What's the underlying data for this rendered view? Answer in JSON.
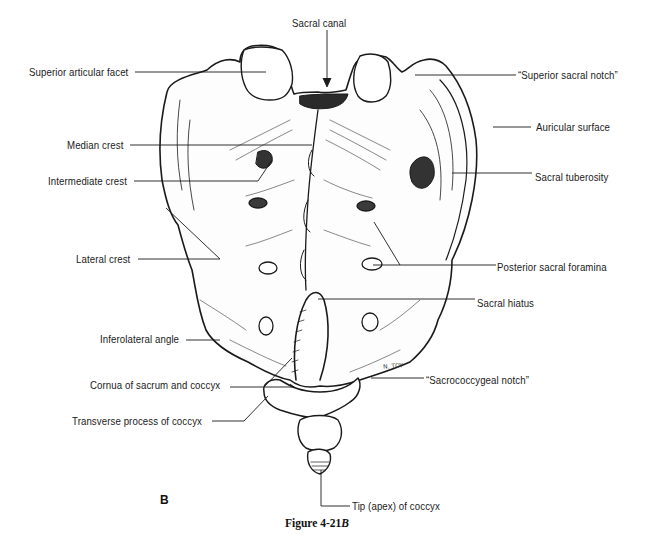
{
  "figure": {
    "panel_letter": "B",
    "caption_prefix": "Figure 4-21",
    "caption_suffix": "B",
    "signature": "N. TOY"
  },
  "labels": {
    "sacral_canal": "Sacral canal",
    "superior_articular_facet": "Superior articular facet",
    "superior_sacral_notch": "“Superior sacral notch”",
    "median_crest": "Median crest",
    "auricular_surface": "Auricular surface",
    "intermediate_crest": "Intermediate crest",
    "sacral_tuberosity": "Sacral tuberosity",
    "lateral_crest": "Lateral crest",
    "posterior_sacral_foramina": "Posterior sacral foramina",
    "sacral_hiatus": "Sacral hiatus",
    "inferolateral_angle": "Inferolateral angle",
    "cornua": "Cornua of sacrum and coccyx",
    "sacrococcygeal_notch": "“Sacrococcygeal notch”",
    "transverse_process": "Transverse process of coccyx",
    "tip_of_coccyx": "Tip (apex) of coccyx"
  },
  "colors": {
    "ink": "#1a1a1a",
    "background": "#ffffff"
  }
}
